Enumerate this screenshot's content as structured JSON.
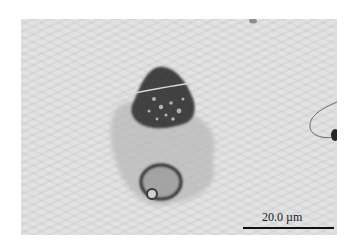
{
  "image": {
    "description": "Grayscale light micrograph of a stained cell cluster on a wavy-textured background",
    "background_color": "#e4e4e4",
    "specimen_dark_color": "#3a3a3a",
    "specimen_light_color": "#b5b5b5"
  },
  "scale_bar": {
    "label": "20.0 µm",
    "color": "#111111"
  }
}
